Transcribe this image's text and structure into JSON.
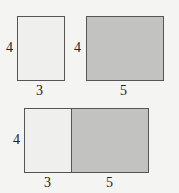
{
  "top": {
    "left_rect": {
      "width_label": "3",
      "height_label": "4",
      "fill": "#efefed"
    },
    "right_rect": {
      "width_label": "5",
      "height_label": "4",
      "fill": "#c2c2c0"
    }
  },
  "bottom": {
    "combined_rect": {
      "height_label": "4",
      "left_width_label": "3",
      "right_width_label": "5",
      "left_fill": "#efefed",
      "right_fill": "#c2c2c0"
    }
  }
}
